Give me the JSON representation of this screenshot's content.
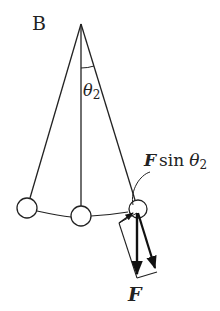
{
  "diagram": {
    "panel_label": "B",
    "angle_label": {
      "symbol": "θ",
      "subscript": "2"
    },
    "component_label": {
      "force": "F",
      "func": "sin",
      "symbol": "θ",
      "subscript": "2"
    },
    "force_label": "F",
    "colors": {
      "stroke": "#222222",
      "background": "#ffffff"
    }
  }
}
